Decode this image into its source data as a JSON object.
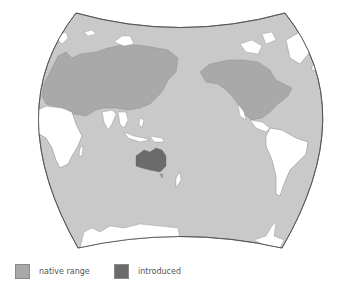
{
  "map": {
    "projection": "world-map-pacific-centered",
    "colors": {
      "ocean": "#c9c9c9",
      "not_present": "#ffffff",
      "native_range": "#a9a9a9",
      "introduced": "#6b6b6b",
      "border": "#5a5a5a"
    }
  },
  "legend": {
    "items": [
      {
        "label": "native range",
        "color": "#a9a9a9"
      },
      {
        "label": "introduced",
        "color": "#6b6b6b"
      }
    ]
  }
}
